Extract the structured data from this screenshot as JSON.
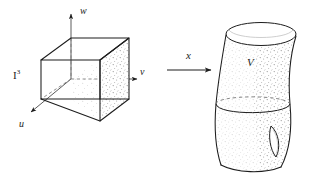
{
  "figure": {
    "background_color": "#ffffff",
    "ink_color": "#1d1d1d",
    "stipple_color": "#9a9a9a"
  },
  "domain_object": {
    "name": "unit-cube",
    "label": "I",
    "label_superscript": "3",
    "label_full": "I³",
    "axes": [
      {
        "id": "w",
        "label": "w",
        "direction": "up"
      },
      {
        "id": "v",
        "label": "v",
        "direction": "right"
      },
      {
        "id": "u",
        "label": "u",
        "direction": "down-left"
      }
    ]
  },
  "map_arrow": {
    "name": "map-x",
    "label": "x",
    "direction": "right"
  },
  "image_object": {
    "name": "solid-region",
    "label": "V",
    "features": [
      {
        "name": "top-rim-ellipse",
        "style": "solid"
      },
      {
        "name": "cross-section-ellipse",
        "style": "dashed-back-solid-front"
      },
      {
        "name": "hole",
        "style": "lens"
      },
      {
        "name": "bottom-edge",
        "style": "solid"
      }
    ]
  }
}
